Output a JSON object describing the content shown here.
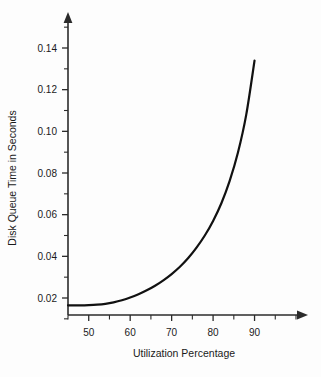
{
  "chart_data": {
    "type": "line",
    "title": "",
    "xlabel": "Utilization Percentage",
    "ylabel": "Disk Queue Time in Seconds",
    "xlim": [
      45,
      100
    ],
    "ylim": [
      0.0,
      0.155
    ],
    "grid": false,
    "legend": null,
    "x_ticks_major": [
      50,
      60,
      70,
      80,
      90
    ],
    "x_ticks_major_labels": [
      "50",
      "60",
      "70",
      "80",
      "90"
    ],
    "x_ticks_minor": [
      45,
      55,
      65,
      75,
      85,
      95,
      100
    ],
    "y_ticks_major": [
      0.02,
      0.04,
      0.06,
      0.08,
      0.1,
      0.12,
      0.14
    ],
    "y_ticks_major_labels": [
      "0.02",
      "0.04",
      "0.06",
      "0.08",
      "0.10",
      "0.12",
      "0.14"
    ],
    "y_ticks_minor": [
      0.01,
      0.03,
      0.05,
      0.07,
      0.09,
      0.11,
      0.13,
      0.15
    ],
    "series": [
      {
        "name": "Disk Queue Time",
        "x": [
          45,
          48,
          50,
          52,
          54,
          56,
          58,
          60,
          62,
          64,
          66,
          68,
          70,
          72,
          74,
          76,
          78,
          80,
          82,
          84,
          86,
          88,
          90
        ],
        "values": [
          0.0165,
          0.0165,
          0.0166,
          0.0168,
          0.0172,
          0.0179,
          0.0189,
          0.0202,
          0.0218,
          0.0237,
          0.0259,
          0.0285,
          0.0315,
          0.035,
          0.0392,
          0.0442,
          0.05,
          0.057,
          0.0655,
          0.0762,
          0.0898,
          0.108,
          0.134
        ]
      }
    ],
    "annotations": [],
    "colors": {
      "curve": "#111111",
      "axis": "#2b2b2b",
      "text": "#1a1a1a",
      "background": "#fdfdfd"
    }
  },
  "axis": {
    "x_label": "Utilization Percentage",
    "y_label": "Disk Queue Time in Seconds"
  },
  "icons": {
    "y_axis_arrow": "arrow-up-icon",
    "x_axis_arrow": "arrow-right-icon"
  }
}
